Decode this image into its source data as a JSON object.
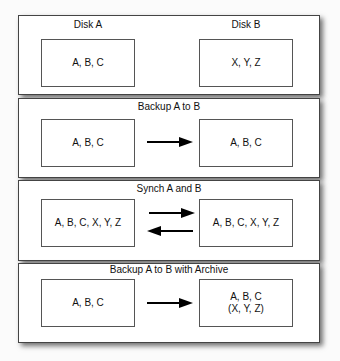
{
  "panels": [
    {
      "title": "",
      "left_label": "Disk A",
      "right_label": "Disk B",
      "left_box": [
        "A, B, C"
      ],
      "right_box": [
        "X, Y, Z"
      ],
      "arrows": []
    },
    {
      "title": "Backup A to B",
      "left_box": [
        "A, B, C"
      ],
      "right_box": [
        "A, B, C"
      ],
      "arrows": [
        "right"
      ]
    },
    {
      "title": "Synch A and B",
      "left_box": [
        "A, B, C, X, Y, Z"
      ],
      "right_box": [
        "A, B, C, X, Y, Z"
      ],
      "arrows": [
        "right",
        "left"
      ]
    },
    {
      "title": "Backup A to B with Archive",
      "left_box": [
        "A, B, C"
      ],
      "right_box": [
        "A, B, C",
        "(X, Y, Z)"
      ],
      "arrows": [
        "right"
      ]
    }
  ],
  "colors": {
    "border": "#444444",
    "arrow": "#000000",
    "background": "#ffffff"
  }
}
